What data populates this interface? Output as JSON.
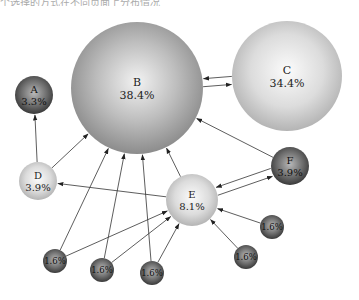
{
  "header": {
    "cropped_text": "个选择的方式在不同页面上分布情况"
  },
  "nodes": [
    {
      "id": "A",
      "label": "A",
      "value": "3.3%",
      "cx": 34,
      "cy": 95,
      "r": 19,
      "shade": "dark"
    },
    {
      "id": "B",
      "label": "B",
      "value": "38.4%",
      "cx": 137,
      "cy": 88,
      "r": 66,
      "shade": "mid"
    },
    {
      "id": "C",
      "label": "C",
      "value": "34.4%",
      "cx": 287,
      "cy": 76,
      "r": 55,
      "shade": "light"
    },
    {
      "id": "D",
      "label": "D",
      "value": "3.9%",
      "cx": 38,
      "cy": 181,
      "r": 19,
      "shade": "light"
    },
    {
      "id": "E",
      "label": "E",
      "value": "8.1%",
      "cx": 192,
      "cy": 200,
      "r": 26,
      "shade": "light"
    },
    {
      "id": "F",
      "label": "F",
      "value": "3.9%",
      "cx": 290,
      "cy": 166,
      "r": 19,
      "shade": "dark"
    },
    {
      "id": "S1",
      "label": "",
      "value": "1.6%",
      "cx": 55,
      "cy": 261,
      "r": 12,
      "shade": "dark"
    },
    {
      "id": "S2",
      "label": "",
      "value": "1.6%",
      "cx": 102,
      "cy": 270,
      "r": 12,
      "shade": "dark"
    },
    {
      "id": "S3",
      "label": "",
      "value": "1.6%",
      "cx": 152,
      "cy": 273,
      "r": 12,
      "shade": "dark"
    },
    {
      "id": "S4",
      "label": "",
      "value": "1.6%",
      "cx": 272,
      "cy": 227,
      "r": 12,
      "shade": "dark"
    },
    {
      "id": "S5",
      "label": "",
      "value": "1.6%",
      "cx": 246,
      "cy": 257,
      "r": 12,
      "shade": "dark"
    }
  ],
  "edges": [
    {
      "from": "D",
      "to": "A"
    },
    {
      "from": "D",
      "to": "B"
    },
    {
      "from": "B",
      "to": "C"
    },
    {
      "from": "C",
      "to": "B"
    },
    {
      "from": "F",
      "to": "B"
    },
    {
      "from": "E",
      "to": "B"
    },
    {
      "from": "E",
      "to": "D"
    },
    {
      "from": "E",
      "to": "F"
    },
    {
      "from": "F",
      "to": "E"
    },
    {
      "from": "S1",
      "to": "B"
    },
    {
      "from": "S1",
      "to": "E"
    },
    {
      "from": "S2",
      "to": "B"
    },
    {
      "from": "S2",
      "to": "E"
    },
    {
      "from": "S3",
      "to": "B"
    },
    {
      "from": "S3",
      "to": "E"
    },
    {
      "from": "S4",
      "to": "E"
    },
    {
      "from": "S5",
      "to": "E"
    }
  ]
}
